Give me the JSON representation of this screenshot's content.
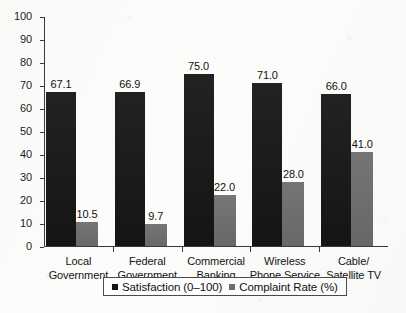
{
  "chart_data": {
    "type": "bar",
    "title": "",
    "xlabel": "",
    "ylabel": "",
    "ylim": [
      0,
      100
    ],
    "yticks": [
      0,
      10,
      20,
      30,
      40,
      50,
      60,
      70,
      80,
      90,
      100
    ],
    "grid": false,
    "legend_position": "bottom",
    "categories": [
      "Local\nGovernment",
      "Federal\nGovernment",
      "Commercial\nBanking",
      "Wireless\nPhone Service",
      "Cable/\nSatellite TV"
    ],
    "series": [
      {
        "name": "Satisfaction (0–100)",
        "color": "#161616",
        "values": [
          67.1,
          66.9,
          75.0,
          71.0,
          66.0
        ],
        "labels": [
          "67.1",
          "66.9",
          "75.0",
          "71.0",
          "66.0"
        ]
      },
      {
        "name": "Complaint Rate (%)",
        "color": "#6e6e6e",
        "values": [
          10.5,
          9.7,
          22.0,
          28.0,
          41.0
        ],
        "labels": [
          "10.5",
          "9.7",
          "22.0",
          "28.0",
          "41.0"
        ]
      }
    ]
  },
  "axis": {
    "y_tick_labels": [
      "100",
      "90",
      "80",
      "70",
      "60",
      "50",
      "40",
      "30",
      "20",
      "10",
      "0"
    ]
  },
  "legend": {
    "items": [
      {
        "label": "Satisfaction (0–100)",
        "color": "#161616"
      },
      {
        "label": "Complaint Rate (%)",
        "color": "#6e6e6e"
      }
    ]
  }
}
